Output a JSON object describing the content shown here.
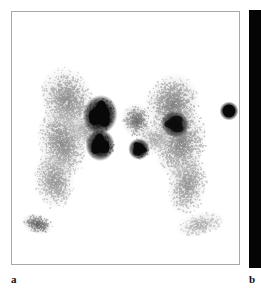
{
  "figure": {
    "kind": "scintigraphy-figure",
    "width": 261,
    "height": 289,
    "background_color": "#ffffff",
    "panels": [
      {
        "id": "a",
        "label": "a",
        "label_position": {
          "x": 11,
          "y": 274
        },
        "frame": {
          "x": 11,
          "y": 11,
          "width": 229,
          "height": 254
        },
        "border_color": "#a8a8a8",
        "background_color": "#ffffff",
        "modality": "planar nuclear medicine scintigram",
        "tracer_color": "#101010"
      },
      {
        "id": "b",
        "label": "b",
        "label_position": {
          "x": 249,
          "y": 274
        },
        "frame": {
          "x": 249,
          "y": 10,
          "width": 12,
          "height": 258
        },
        "background_color": "#050505",
        "note": "only left edge of adjacent panel is visible"
      }
    ]
  },
  "chart_data": {
    "type": "heatmap",
    "title": "",
    "xlabel": "",
    "ylabel": "",
    "grid": false,
    "legend": "none",
    "colormap": "grayscale-inverted",
    "xlim": [
      0,
      229
    ],
    "ylim": [
      0,
      254
    ],
    "noise": {
      "speckle_seed": 20240517,
      "grain_count": 9000
    },
    "regions": [
      {
        "name": "left-gland-upper-lobe",
        "shape": "blob",
        "cx": 55,
        "cy": 88,
        "rx": 22,
        "ry": 28,
        "rot": -18,
        "intensity": 0.4,
        "density": 0.55
      },
      {
        "name": "left-gland-mid-body",
        "shape": "blob",
        "cx": 50,
        "cy": 130,
        "rx": 20,
        "ry": 30,
        "rot": -10,
        "intensity": 0.42,
        "density": 0.58
      },
      {
        "name": "left-gland-lower-tail",
        "shape": "blob",
        "cx": 42,
        "cy": 168,
        "rx": 17,
        "ry": 24,
        "rot": -8,
        "intensity": 0.38,
        "density": 0.52
      },
      {
        "name": "left-isthmus-bridge",
        "shape": "blob",
        "cx": 73,
        "cy": 118,
        "rx": 16,
        "ry": 12,
        "rot": 12,
        "intensity": 0.3,
        "density": 0.4
      },
      {
        "name": "left-hot-nodule-superior",
        "shape": "focus",
        "cx": 88,
        "cy": 103,
        "rx": 13,
        "ry": 15,
        "rot": 12,
        "intensity": 0.97,
        "density": 1.0
      },
      {
        "name": "left-hot-nodule-inferior",
        "shape": "focus",
        "cx": 88,
        "cy": 133,
        "rx": 11,
        "ry": 12,
        "rot": -5,
        "intensity": 0.96,
        "density": 1.0
      },
      {
        "name": "left-shoulder-activity",
        "shape": "blob",
        "cx": 25,
        "cy": 212,
        "rx": 13,
        "ry": 8,
        "rot": 18,
        "intensity": 0.62,
        "density": 0.7
      },
      {
        "name": "right-gland-upper-lobe",
        "shape": "blob",
        "cx": 160,
        "cy": 92,
        "rx": 22,
        "ry": 26,
        "rot": 16,
        "intensity": 0.45,
        "density": 0.6
      },
      {
        "name": "right-gland-mid-body",
        "shape": "blob",
        "cx": 168,
        "cy": 130,
        "rx": 21,
        "ry": 30,
        "rot": 12,
        "intensity": 0.44,
        "density": 0.6
      },
      {
        "name": "right-gland-lower-tail",
        "shape": "blob",
        "cx": 175,
        "cy": 172,
        "rx": 16,
        "ry": 26,
        "rot": 10,
        "intensity": 0.38,
        "density": 0.52
      },
      {
        "name": "right-medial-nodule",
        "shape": "blob",
        "cx": 124,
        "cy": 108,
        "rx": 12,
        "ry": 14,
        "rot": -6,
        "intensity": 0.55,
        "density": 0.7
      },
      {
        "name": "right-hot-focus-inferomedial",
        "shape": "focus",
        "cx": 127,
        "cy": 137,
        "rx": 8,
        "ry": 8,
        "rot": 0,
        "intensity": 0.9,
        "density": 0.96
      },
      {
        "name": "right-hot-focus-central",
        "shape": "focus",
        "cx": 163,
        "cy": 112,
        "rx": 11,
        "ry": 10,
        "rot": 20,
        "intensity": 0.8,
        "density": 0.9
      },
      {
        "name": "right-isthmus-bridge",
        "shape": "blob",
        "cx": 143,
        "cy": 126,
        "rx": 16,
        "ry": 13,
        "rot": -14,
        "intensity": 0.3,
        "density": 0.4
      },
      {
        "name": "right-shoulder-activity",
        "shape": "blob",
        "cx": 188,
        "cy": 212,
        "rx": 20,
        "ry": 10,
        "rot": -14,
        "intensity": 0.28,
        "density": 0.38
      },
      {
        "name": "external-point-marker",
        "shape": "marker",
        "cx": 217,
        "cy": 99,
        "rx": 7,
        "ry": 7,
        "rot": 0,
        "intensity": 1.0,
        "density": 1.0
      }
    ]
  }
}
